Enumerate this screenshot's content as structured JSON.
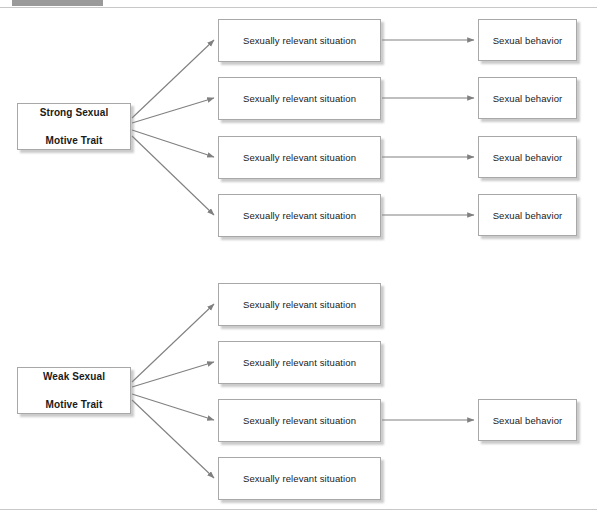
{
  "page": {
    "background_color": "#ffffff",
    "header_bar_color": "#9a9a9a",
    "rule_color": "#c8c8c8",
    "box_border_color": "#a8a8a8",
    "box_fill_color": "#ffffff",
    "arrow_color": "#808080",
    "text_color": "#1a1a1a"
  },
  "diagram": {
    "type": "flowchart",
    "labels": {
      "situation": "Sexually relevant situation",
      "behavior": "Sexual behavior",
      "strong_trait": "Strong Sexual\nMotive Trait",
      "strong_trait_line1": "Strong Sexual",
      "strong_trait_line2": "Motive Trait",
      "weak_trait_line1": "Weak Sexual",
      "weak_trait_line2": "Motive Trait"
    },
    "groups": [
      {
        "id": "strong",
        "trait_line1": "Strong Sexual",
        "trait_line2": "Motive Trait",
        "rows": [
          {
            "situation": "Sexually relevant situation",
            "behavior": "Sexual behavior",
            "has_behavior": true
          },
          {
            "situation": "Sexually relevant situation",
            "behavior": "Sexual behavior",
            "has_behavior": true
          },
          {
            "situation": "Sexually relevant situation",
            "behavior": "Sexual behavior",
            "has_behavior": true
          },
          {
            "situation": "Sexually relevant situation",
            "behavior": "Sexual behavior",
            "has_behavior": true
          }
        ]
      },
      {
        "id": "weak",
        "trait_line1": "Weak Sexual",
        "trait_line2": "Motive Trait",
        "rows": [
          {
            "situation": "Sexually relevant situation",
            "behavior": "",
            "has_behavior": false
          },
          {
            "situation": "Sexually relevant situation",
            "behavior": "",
            "has_behavior": false
          },
          {
            "situation": "Sexually relevant situation",
            "behavior": "Sexual behavior",
            "has_behavior": true
          },
          {
            "situation": "Sexually relevant situation",
            "behavior": "",
            "has_behavior": false
          }
        ]
      }
    ]
  }
}
